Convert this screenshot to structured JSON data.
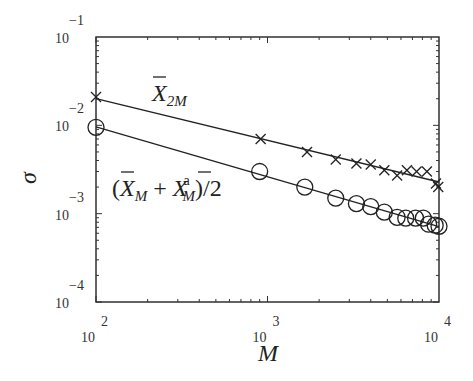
{
  "chart_data": {
    "type": "scatter",
    "title": "",
    "xlabel": "M",
    "ylabel": "σ",
    "xscale": "log",
    "yscale": "log",
    "xlim": [
      100,
      10000
    ],
    "ylim": [
      0.0001,
      0.1
    ],
    "grid": false,
    "x_ticks": [
      {
        "base": "10",
        "exp": "2"
      },
      {
        "base": "10",
        "exp": "3"
      },
      {
        "base": "10",
        "exp": "4"
      }
    ],
    "y_ticks": [
      {
        "base": "10",
        "exp": "−1"
      },
      {
        "base": "10",
        "exp": "−2"
      },
      {
        "base": "10",
        "exp": "−3"
      },
      {
        "base": "10",
        "exp": "−4"
      }
    ],
    "series": [
      {
        "name": "X̄_2M",
        "marker": "x",
        "fit_line": true,
        "x": [
          100,
          912,
          1700,
          2500,
          3300,
          4000,
          4800,
          5700,
          6500,
          7400,
          8500,
          9600,
          9900
        ],
        "y": [
          0.0209,
          0.007,
          0.005,
          0.0041,
          0.0037,
          0.0036,
          0.0031,
          0.0027,
          0.0031,
          0.003,
          0.003,
          0.0022,
          0.002
        ]
      },
      {
        "name": "(X̄_M + X̄_M^a)/2",
        "marker": "o",
        "fit_line": true,
        "x": [
          100,
          900,
          1650,
          2500,
          3300,
          4000,
          4800,
          5700,
          6400,
          7300,
          8100,
          8700,
          9500,
          10000
        ],
        "y": [
          0.0095,
          0.003,
          0.002,
          0.0015,
          0.0013,
          0.0012,
          0.00104,
          0.00091,
          0.00089,
          0.00089,
          0.00089,
          0.00076,
          0.00074,
          0.00072
        ]
      }
    ],
    "annotations": [
      {
        "text": "X̄_2M",
        "near_series": 0
      },
      {
        "text": "(X̄_M + X̄_M^a)/2",
        "near_series": 1
      }
    ]
  },
  "labels": {
    "xlabel": "M",
    "ylabel": "σ",
    "ann1": {
      "open": "(",
      "X": "X",
      "sub1": "M",
      "plus": " + ",
      "X2": "X",
      "sup": "a",
      "sub2": "M",
      "close": ")/2"
    },
    "ann0": {
      "X": "X",
      "sub": "2M"
    }
  }
}
